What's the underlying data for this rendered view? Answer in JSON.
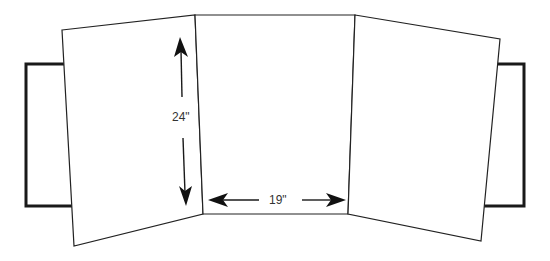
{
  "diagram": {
    "dimensions": {
      "height_label": "24\"",
      "width_label": "19\""
    },
    "panels": [
      {
        "id": "left-panel",
        "points": "62,30 195,15 203,214 74,246"
      },
      {
        "id": "center-panel",
        "points": "195,15 355,15 348,214 203,214"
      },
      {
        "id": "right-panel",
        "points": "355,15 500,39 481,241 348,214"
      }
    ],
    "tabs": [
      {
        "id": "left-tab",
        "points": "64,64 26,64 26,206 72,206"
      },
      {
        "id": "right-tab",
        "points": "497,64 524,64 524,206 484,206"
      }
    ],
    "colors": {
      "stroke": "#222222",
      "fill": "#ffffff",
      "arrow": "#111111",
      "text": "#333333"
    }
  }
}
